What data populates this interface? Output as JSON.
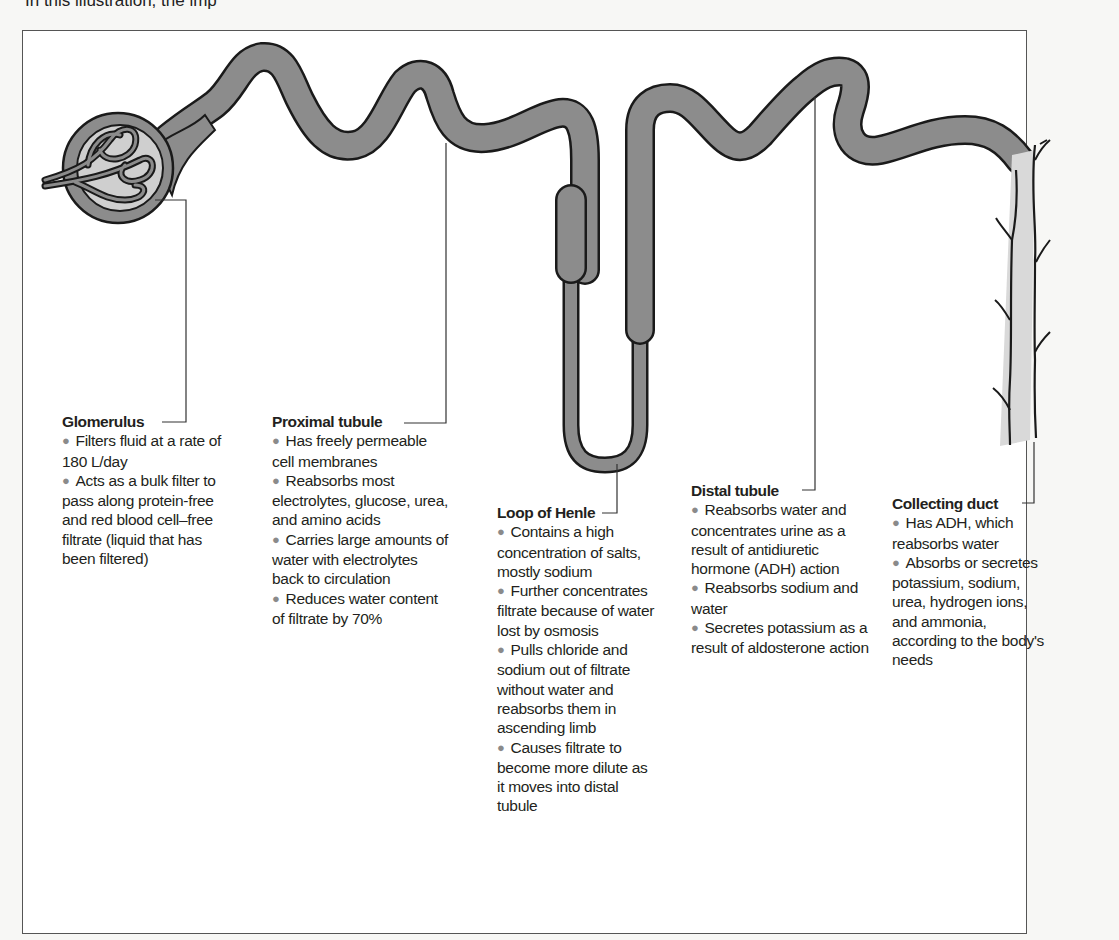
{
  "caption": "In this illustration, the imp",
  "figure": {
    "structures": [
      {
        "id": "glomerulus",
        "title": "Glomerulus",
        "bullets": [
          "Filters fluid at a rate of 180 L/day",
          "Acts as a bulk filter to pass along protein-free and red blood cell–free filtrate (liquid that has been filtered)"
        ]
      },
      {
        "id": "proximal-tubule",
        "title": "Proximal tubule",
        "bullets": [
          "Has freely permeable cell membranes",
          "Reabsorbs most electrolytes, glucose, urea, and amino acids",
          "Carries large amounts of water with electrolytes back to circulation",
          "Reduces water content of filtrate by 70%"
        ]
      },
      {
        "id": "loop-of-henle",
        "title": "Loop of Henle",
        "bullets": [
          "Contains a high concentration of salts, mostly sodium",
          "Further concentrates filtrate because of water lost by osmosis",
          "Pulls chloride and sodium out of filtrate without water and reabsorbs them in ascending limb",
          "Causes filtrate to become more dilute as it moves into distal tubule"
        ]
      },
      {
        "id": "distal-tubule",
        "title": "Distal tubule",
        "bullets": [
          "Reabsorbs water and concentrates urine as a result of antidiuretic hormone (ADH) action",
          "Reabsorbs sodium and water",
          "Secretes potassium as a result of aldosterone action"
        ]
      },
      {
        "id": "collecting-duct",
        "title": "Collecting duct",
        "bullets": [
          "Has ADH, which reabsorbs water",
          "Absorbs or secretes potassium, sodium, urea, hydrogen ions, and ammonia, according to the body's needs"
        ]
      }
    ],
    "colors": {
      "tubule_fill": "#8c8c8c",
      "duct_fill": "#d9d9d9",
      "capsule_inner": "#cfcfcf",
      "outline": "#1a1a1a",
      "bullet_dot": "#8a8a8a"
    }
  }
}
